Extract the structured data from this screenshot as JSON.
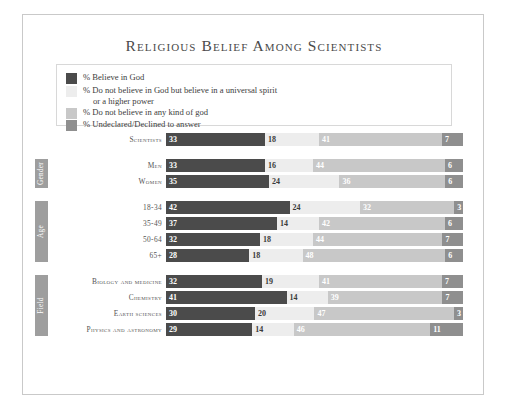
{
  "title": "Religious Belief Among Scientists",
  "legend": {
    "items": [
      {
        "label": "% Believe in God",
        "label2": "",
        "color": "#4b4b4b"
      },
      {
        "label": "% Do not believe in God but believe in a universal spirit",
        "label2": "or a higher power",
        "color": "#ededed"
      },
      {
        "label": "% Do not believe in any kind of god",
        "label2": "",
        "color": "#c8c8c8"
      },
      {
        "label": "% Undeclared/Declined to answer",
        "label2": "",
        "color": "#8f8f8f"
      }
    ]
  },
  "groups": [
    {
      "tab": "",
      "rows": [
        {
          "label": "Scientists",
          "values": [
            33,
            18,
            41,
            7
          ]
        }
      ]
    },
    {
      "tab": "Gender",
      "rows": [
        {
          "label": "Men",
          "values": [
            33,
            16,
            44,
            6
          ]
        },
        {
          "label": "Women",
          "values": [
            35,
            24,
            36,
            6
          ]
        }
      ]
    },
    {
      "tab": "Age",
      "rows": [
        {
          "label": "18-34",
          "values": [
            42,
            24,
            32,
            3
          ]
        },
        {
          "label": "35-49",
          "values": [
            37,
            14,
            42,
            6
          ]
        },
        {
          "label": "50-64",
          "values": [
            32,
            18,
            44,
            7
          ]
        },
        {
          "label": "65+",
          "values": [
            28,
            18,
            48,
            6
          ]
        }
      ]
    },
    {
      "tab": "Field",
      "rows": [
        {
          "label": "Biology and medicine",
          "values": [
            32,
            19,
            41,
            7
          ]
        },
        {
          "label": "Chemistry",
          "values": [
            41,
            14,
            39,
            7
          ]
        },
        {
          "label": "Earth sciences",
          "values": [
            30,
            20,
            47,
            3
          ]
        },
        {
          "label": "Physics and astronomy",
          "values": [
            29,
            14,
            46,
            11
          ]
        }
      ]
    }
  ],
  "chart_data": {
    "type": "bar",
    "orientation": "horizontal",
    "stacked": true,
    "normalized_percent": true,
    "title": "Religious Belief Among Scientists",
    "xlabel": "",
    "ylabel": "",
    "xlim": [
      0,
      100
    ],
    "grid": false,
    "legend_position": "top-left",
    "series": [
      {
        "name": "% Believe in God",
        "color": "#4b4b4b",
        "values": [
          33,
          33,
          35,
          42,
          37,
          32,
          28,
          32,
          41,
          30,
          29
        ]
      },
      {
        "name": "% Do not believe in God but believe in a universal spirit or a higher power",
        "color": "#ededed",
        "values": [
          18,
          16,
          24,
          24,
          14,
          18,
          18,
          19,
          14,
          20,
          14
        ]
      },
      {
        "name": "% Do not believe in any kind of god",
        "color": "#c8c8c8",
        "values": [
          41,
          44,
          36,
          32,
          42,
          44,
          48,
          41,
          39,
          47,
          46
        ]
      },
      {
        "name": "% Undeclared/Declined to answer",
        "color": "#8f8f8f",
        "values": [
          7,
          6,
          6,
          3,
          6,
          7,
          6,
          7,
          7,
          3,
          11
        ]
      }
    ],
    "categories": [
      "Scientists",
      "Men",
      "Women",
      "18-34",
      "35-49",
      "50-64",
      "65+",
      "Biology and medicine",
      "Chemistry",
      "Earth sciences",
      "Physics and astronomy"
    ],
    "category_groups": [
      {
        "name": "",
        "categories": [
          "Scientists"
        ]
      },
      {
        "name": "Gender",
        "categories": [
          "Men",
          "Women"
        ]
      },
      {
        "name": "Age",
        "categories": [
          "18-34",
          "35-49",
          "50-64",
          "65+"
        ]
      },
      {
        "name": "Field",
        "categories": [
          "Biology and medicine",
          "Chemistry",
          "Earth sciences",
          "Physics and astronomy"
        ]
      }
    ]
  }
}
